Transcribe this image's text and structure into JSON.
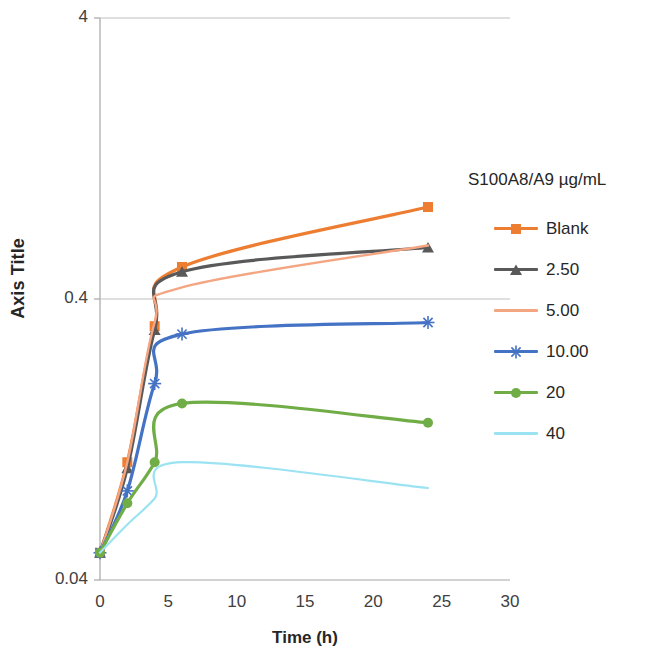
{
  "chart_data": {
    "type": "line",
    "title": "",
    "xlabel": "Time (h)",
    "ylabel": "Axis Title",
    "xlim": [
      0,
      30
    ],
    "ylim": [
      0.04,
      4
    ],
    "yscale": "log",
    "grid": "horizontal",
    "legend_position": "right",
    "legend_title": "S100A8/A9 µg/mL",
    "xticks": [
      "0",
      "5",
      "10",
      "15",
      "20",
      "25",
      "30"
    ],
    "yticks": [
      "0.04",
      "0.4",
      "4"
    ],
    "x": [
      0,
      2,
      4,
      6,
      24
    ],
    "series": [
      {
        "name": "Blank",
        "color": "#ED7D31",
        "marker": "square",
        "values": [
          0.05,
          0.105,
          0.32,
          0.52,
          0.85
        ]
      },
      {
        "name": "2.50",
        "color": "#595959",
        "marker": "triangle",
        "values": [
          0.05,
          0.1,
          0.31,
          0.5,
          0.61
        ]
      },
      {
        "name": "5.00",
        "color": "#F4A582",
        "marker": "none",
        "values": [
          0.05,
          0.105,
          0.33,
          0.44,
          0.62
        ]
      },
      {
        "name": "10.00",
        "color": "#4472C4",
        "marker": "asterisk",
        "values": [
          0.05,
          0.083,
          0.2,
          0.3,
          0.33
        ]
      },
      {
        "name": "20",
        "color": "#70AD47",
        "marker": "circle",
        "values": [
          0.05,
          0.075,
          0.105,
          0.17,
          0.145
        ]
      },
      {
        "name": "40",
        "color": "#9BE3F2",
        "marker": "none",
        "values": [
          0.05,
          0.063,
          0.078,
          0.105,
          0.085
        ]
      }
    ]
  }
}
